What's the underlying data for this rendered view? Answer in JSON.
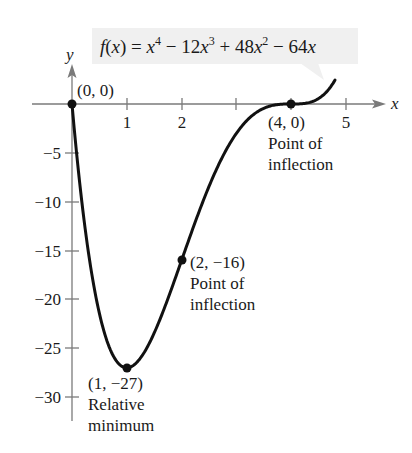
{
  "chart_data": {
    "type": "line",
    "function_label": {
      "f": "f",
      "lp": "(",
      "x": "x",
      "rp_eq": ") = ",
      "x1": "x",
      "e1": "4",
      "t2": " − 12",
      "x2": "x",
      "e2": "3",
      "t3": " + 48",
      "x3": "x",
      "e3": "2",
      "t4": " − 64",
      "x4": "x"
    },
    "xlabel": "x",
    "ylabel": "y",
    "xlim": [
      0,
      5.5
    ],
    "ylim": [
      -32,
      3
    ],
    "x_ticks": [
      "1",
      "2",
      "3",
      "4",
      "5"
    ],
    "x_tick_labels_shown": [
      "1",
      "2",
      "5"
    ],
    "y_ticks": [
      "−5",
      "−10",
      "−15",
      "−20",
      "−25",
      "−30"
    ],
    "grid": false,
    "series": [
      {
        "name": "f(x)",
        "x": [
          0,
          0.1,
          0.2,
          0.3,
          0.4,
          0.5,
          0.6,
          0.7,
          0.8,
          0.9,
          1.0,
          1.2,
          1.4,
          1.6,
          1.8,
          2.0,
          2.2,
          2.4,
          2.6,
          2.8,
          3.0,
          3.2,
          3.4,
          3.6,
          3.8,
          4.0,
          4.2,
          4.4,
          4.6,
          4.8
        ],
        "values": [
          0,
          -5.93,
          -10.97,
          -15.2,
          -18.66,
          -21.44,
          -23.58,
          -25.16,
          -26.21,
          -26.81,
          -27,
          -26.34,
          -24.61,
          -22.12,
          -19.17,
          -16,
          -12.83,
          -9.83,
          -7.13,
          -4.84,
          -3,
          -1.64,
          -0.73,
          -0.23,
          -0.03,
          0,
          0.03,
          0.28,
          0.99,
          2.46
        ]
      }
    ],
    "annotations": [
      {
        "point": [
          0,
          0
        ],
        "lines": [
          "(0, 0)"
        ]
      },
      {
        "point": [
          1,
          -27
        ],
        "lines": [
          "(1, −27)",
          "Relative",
          "minimum"
        ]
      },
      {
        "point": [
          2,
          -16
        ],
        "lines": [
          "(2, −16)",
          "Point of",
          "inflection"
        ]
      },
      {
        "point": [
          4,
          0
        ],
        "lines": [
          "(4, 0)",
          "Point of",
          "inflection"
        ]
      }
    ]
  }
}
